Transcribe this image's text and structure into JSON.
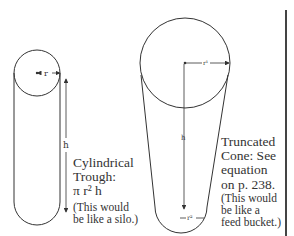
{
  "cylinder": {
    "radius_label": "r",
    "height_label": "h",
    "title_line1": "Cylindrical",
    "title_line2": "Trough:",
    "formula": "π r² h",
    "note_line1": "(This would",
    "note_line2": "be like a silo.)"
  },
  "cone": {
    "top_radius_label": "r¹",
    "bottom_radius_label": "r²",
    "height_label": "h",
    "title_line1": "Truncated",
    "title_line2": "Cone: See",
    "title_line3": "equation",
    "title_line4": "on p. 238.",
    "note_line1": "(This would",
    "note_line2": "be like a",
    "note_line3": "feed bucket.)"
  },
  "colors": {
    "stroke": "#333333",
    "divider": "#444444"
  }
}
